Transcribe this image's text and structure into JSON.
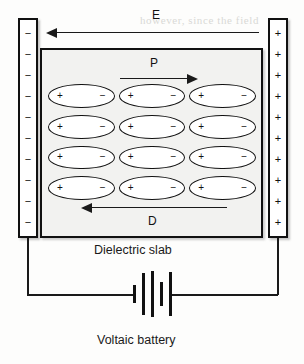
{
  "diagram": {
    "captions": {
      "slab_caption": "Dielectric slab",
      "battery_caption": "Voltaic battery"
    },
    "field_labels": {
      "electric_field": "E",
      "polarization": "P",
      "displacement": "D"
    },
    "arrows": [
      {
        "name": "E",
        "label": "E",
        "direction": "left"
      },
      {
        "name": "P",
        "label": "P",
        "direction": "right"
      },
      {
        "name": "D",
        "label": "D",
        "direction": "left"
      }
    ],
    "plates": {
      "left": {
        "name": "negative-plate",
        "charge_symbol": "−",
        "charge_count": 10,
        "polarity": "negative"
      },
      "right": {
        "name": "positive-plate",
        "charge_symbol": "+",
        "charge_count": 10,
        "polarity": "positive"
      }
    },
    "dipoles": {
      "rows": 4,
      "columns": 3,
      "positive_symbol": "+",
      "negative_symbol": "−"
    },
    "battery": {
      "plate_count": 5,
      "plate_heights": [
        18,
        42,
        46,
        24,
        44
      ]
    },
    "colors": {
      "ink": "#111111",
      "slab_fill": "#f2f2f0",
      "plate_fill": "#ffffff",
      "page": "#fdfdfc"
    },
    "bleed_text": [
      "however, since the field",
      "domain the direction of",
      "may be so and to be dis-",
      "the dipole-slab in the d"
    ]
  }
}
